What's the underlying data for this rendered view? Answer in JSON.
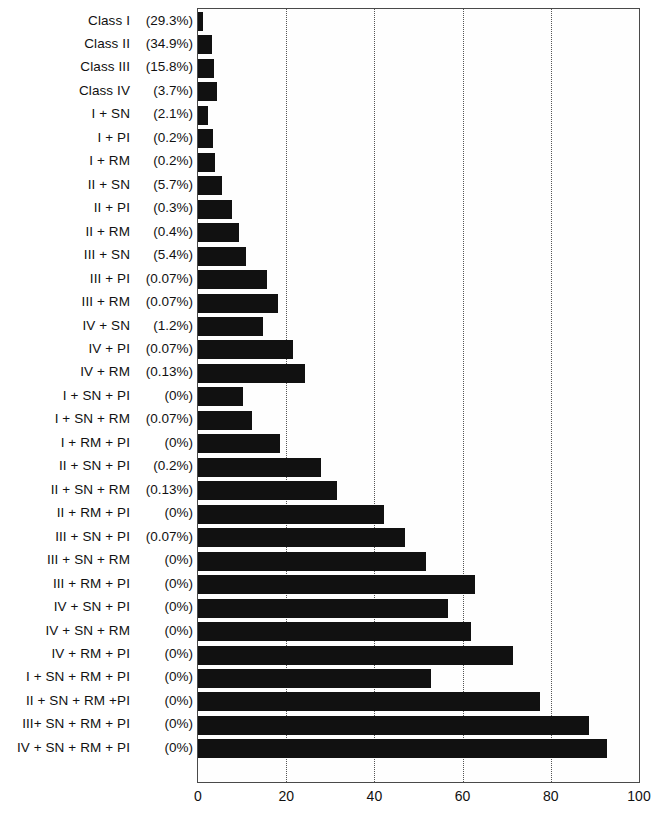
{
  "chart_data": {
    "type": "bar",
    "orientation": "horizontal",
    "title": "",
    "xlabel": "",
    "ylabel": "",
    "xlim": [
      0,
      100
    ],
    "xticks": [
      0,
      20,
      40,
      60,
      80,
      100
    ],
    "xtick_labels": [
      "0",
      "20",
      "40",
      "60",
      "80",
      "100"
    ],
    "grid": "vertical-dotted",
    "legend": "none",
    "bar_color": "#111111",
    "categories": [
      "Class I",
      "Class II",
      "Class III",
      "Class IV",
      "I + SN",
      "I + PI",
      "I + RM",
      "II + SN",
      "II + PI",
      "II + RM",
      "III + SN",
      "III + PI",
      "III + RM",
      "IV + SN",
      "IV + PI",
      "IV + RM",
      "I + SN + PI",
      "I + SN + RM",
      "I + RM + PI",
      "II + SN + PI",
      "II + SN + RM",
      "II + RM + PI",
      "III + SN + PI",
      "III + SN + RM",
      "III + RM + PI",
      "IV + SN + PI",
      "IV + SN + RM",
      "IV + RM + PI",
      "I + SN + RM + PI",
      "II + SN + RM +PI",
      "III+ SN + RM + PI",
      "IV + SN + RM + PI"
    ],
    "percent_labels": [
      "(29.3%)",
      "(34.9%)",
      "(15.8%)",
      "(3.7%)",
      "(2.1%)",
      "(0.2%)",
      "(0.2%)",
      "(5.7%)",
      "(0.3%)",
      "(0.4%)",
      "(5.4%)",
      "(0.07%)",
      "(0.07%)",
      "(1.2%)",
      "(0.07%)",
      "(0.13%)",
      "(0%)",
      "(0.07%)",
      "(0%)",
      "(0.2%)",
      "(0.13%)",
      "(0%)",
      "(0.07%)",
      "(0%)",
      "(0%)",
      "(0%)",
      "(0%)",
      "(0%)",
      "(0%)",
      "(0%)",
      "(0%)",
      "(0%)"
    ],
    "values": [
      1.2,
      3.1,
      3.6,
      4.2,
      2.3,
      3.3,
      3.8,
      5.5,
      7.6,
      9.2,
      10.9,
      15.6,
      18.2,
      14.7,
      21.6,
      24.3,
      10.3,
      12.3,
      18.6,
      27.9,
      31.5,
      42.1,
      47.0,
      51.6,
      62.7,
      56.8,
      61.8,
      71.4,
      52.8,
      77.5,
      88.6,
      92.8
    ]
  }
}
